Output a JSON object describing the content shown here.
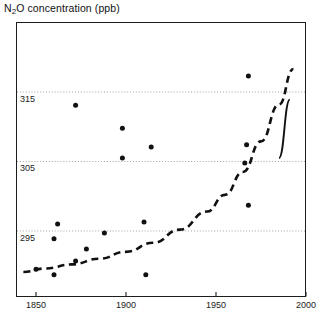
{
  "chart_data": {
    "type": "scatter",
    "title": "N2O concentration (ppb)",
    "title_parts": {
      "lead": "N",
      "sub": "2",
      "tail": "O concentration (ppb)"
    },
    "xlabel": "",
    "ylabel": "",
    "xlim": [
      1840,
      2000
    ],
    "ylim": [
      288,
      322
    ],
    "xticks": [
      1850,
      1900,
      1950,
      2000
    ],
    "xtick_labels": [
      "1850",
      "1900",
      "1950",
      "2000"
    ],
    "yticks": [
      295,
      305,
      315
    ],
    "ytick_labels": [
      "295",
      "305",
      "315"
    ],
    "grid": "horizontal-dotted",
    "legend": "none",
    "series": [
      {
        "name": "ice core measurements",
        "type": "scatter",
        "marker": "filled-circle",
        "color": "#111111",
        "points": [
          {
            "x": 1850,
            "y": 289.5
          },
          {
            "x": 1860,
            "y": 293.9
          },
          {
            "x": 1860,
            "y": 288.7
          },
          {
            "x": 1862,
            "y": 296.0
          },
          {
            "x": 1872,
            "y": 290.7
          },
          {
            "x": 1872,
            "y": 313.1
          },
          {
            "x": 1878,
            "y": 292.4
          },
          {
            "x": 1888,
            "y": 294.7
          },
          {
            "x": 1898,
            "y": 309.8
          },
          {
            "x": 1898,
            "y": 305.5
          },
          {
            "x": 1911,
            "y": 288.7
          },
          {
            "x": 1910,
            "y": 296.3
          },
          {
            "x": 1914,
            "y": 307.1
          },
          {
            "x": 1968,
            "y": 317.3
          },
          {
            "x": 1967,
            "y": 307.4
          },
          {
            "x": 1966,
            "y": 304.8
          },
          {
            "x": 1968,
            "y": 298.7
          }
        ]
      },
      {
        "name": "fitted trend (dashed)",
        "type": "line",
        "style": "dashed",
        "color": "#111111",
        "points": [
          {
            "x": 1843,
            "y": 289.1
          },
          {
            "x": 1855,
            "y": 289.6
          },
          {
            "x": 1870,
            "y": 290.2
          },
          {
            "x": 1885,
            "y": 291.0
          },
          {
            "x": 1900,
            "y": 292.0
          },
          {
            "x": 1915,
            "y": 293.3
          },
          {
            "x": 1930,
            "y": 295.2
          },
          {
            "x": 1945,
            "y": 297.8
          },
          {
            "x": 1955,
            "y": 300.2
          },
          {
            "x": 1965,
            "y": 303.5
          },
          {
            "x": 1975,
            "y": 307.9
          },
          {
            "x": 1985,
            "y": 313.2
          },
          {
            "x": 1993,
            "y": 318.3
          }
        ]
      },
      {
        "name": "modern atmospheric record (solid)",
        "type": "line",
        "style": "solid",
        "color": "#111111",
        "points": [
          {
            "x": 1985,
            "y": 305.5
          },
          {
            "x": 1991,
            "y": 313.9
          }
        ]
      }
    ]
  },
  "axes": {
    "x_tick_positions_px": [
      36,
      126,
      216,
      306
    ],
    "y_tick_positions_px": [
      231,
      162,
      92
    ],
    "plot_box_px": {
      "left": 16,
      "top": 22,
      "width": 290,
      "height": 275
    }
  }
}
